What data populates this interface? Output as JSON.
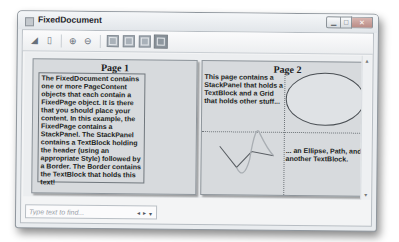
{
  "window": {
    "title": "FixedDocument",
    "controls": {
      "minimize": "▁",
      "maximize": "□",
      "close": "✕"
    }
  },
  "toolbar": {
    "items": [
      {
        "name": "print-button",
        "icon": "print-icon",
        "glyph": "◢"
      },
      {
        "name": "copy-button",
        "icon": "copy-icon",
        "glyph": "▯"
      },
      {
        "name": "zoom-in-button",
        "icon": "zoom-in-icon",
        "glyph": "⊕"
      },
      {
        "name": "zoom-out-button",
        "icon": "zoom-out-icon",
        "glyph": "⊖"
      },
      {
        "name": "actual-size-button",
        "icon": "actual-size-icon"
      },
      {
        "name": "page-width-button",
        "icon": "page-width-icon"
      },
      {
        "name": "whole-page-button",
        "icon": "whole-page-icon"
      },
      {
        "name": "two-pages-button",
        "icon": "two-pages-icon",
        "active": true
      }
    ]
  },
  "pages": [
    {
      "title": "Page 1",
      "text": "The FixedDocument contains one or more PageContent objects that each contain a FixedPage object. It is there that you should place your content. In this example, the FixedPage contains a StackPanel. The StackPanel contains a TextBlock holding the header (using an appropriate Style) followed by a Border. The Border contains the TextBlock that holds this text!"
    },
    {
      "title": "Page 2",
      "text1": "This page contains a StackPanel that holds a TextBlock and a Grid that holds other stuff...",
      "text2": "... an Ellipse, Path, and another TextBlock.",
      "shapes": [
        "ellipse",
        "path"
      ]
    }
  ],
  "find": {
    "placeholder": "Type text to find...",
    "prev": "◂",
    "next": "▸",
    "options": "▾"
  },
  "colors": {
    "page_bg": "#d7dadd",
    "window_chrome": "#e9ecef"
  }
}
